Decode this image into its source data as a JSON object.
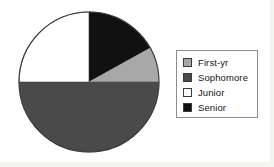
{
  "chart_data": {
    "type": "pie",
    "title": "",
    "categories": [
      "First-yr",
      "Sophomore",
      "Junior",
      "Senior"
    ],
    "values": [
      8,
      50,
      25,
      17
    ],
    "units": "percent",
    "legend_position": "right",
    "grid": false,
    "start_angle_deg": 0,
    "direction": "clockwise",
    "slices": [
      {
        "label": "Senior",
        "percent": 17,
        "color": "#111111",
        "start_deg": 0,
        "end_deg": 61
      },
      {
        "label": "First-yr",
        "percent": 8,
        "color": "#a8a8a8",
        "start_deg": 61,
        "end_deg": 90
      },
      {
        "label": "Sophomore",
        "percent": 50,
        "color": "#4a4a4a",
        "start_deg": 90,
        "end_deg": 270
      },
      {
        "label": "Junior",
        "percent": 25,
        "color": "#ffffff",
        "start_deg": 270,
        "end_deg": 360
      }
    ]
  },
  "pie": {
    "center_x": 72,
    "center_y": 73,
    "radius": 70,
    "outline_color": "#3c3c3c"
  },
  "legend": {
    "border_color": "#8d8d8d",
    "items": [
      {
        "label": "First-yr",
        "swatch_color": "#a8a8a8",
        "swatch_name": "swatch-first-yr"
      },
      {
        "label": "Sophomore",
        "swatch_color": "#4a4a4a",
        "swatch_name": "swatch-sophomore"
      },
      {
        "label": "Junior",
        "swatch_color": "#ffffff",
        "swatch_name": "swatch-junior"
      },
      {
        "label": "Senior",
        "swatch_color": "#111111",
        "swatch_name": "swatch-senior"
      }
    ]
  }
}
